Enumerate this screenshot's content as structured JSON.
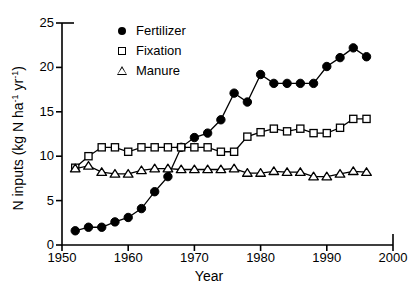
{
  "chart_data": {
    "type": "line",
    "title": "",
    "xlabel": "Year",
    "ylabel": "N inputs (kg N ha-1 yr-1)",
    "ylabel_parts": {
      "prefix": "N inputs (kg N ha",
      "sup1": "-1",
      "mid": " yr",
      "sup2": "-1",
      "suffix": ")"
    },
    "xlim": [
      1950,
      2000
    ],
    "ylim": [
      0,
      25
    ],
    "xticks": [
      1950,
      1960,
      1970,
      1980,
      1990,
      2000
    ],
    "yticks": [
      0,
      5,
      10,
      15,
      20,
      25
    ],
    "grid": false,
    "legend_position": "top-left inside",
    "x": [
      1952,
      1954,
      1956,
      1958,
      1960,
      1962,
      1964,
      1966,
      1968,
      1970,
      1972,
      1974,
      1976,
      1978,
      1980,
      1982,
      1984,
      1986,
      1988,
      1990,
      1992,
      1994,
      1996
    ],
    "series": [
      {
        "name": "Fertilizer",
        "marker": "filled-circle",
        "color": "#000000",
        "values": [
          1.6,
          2.0,
          2.0,
          2.6,
          3.1,
          4.1,
          6.0,
          7.7,
          11.0,
          12.1,
          12.6,
          14.1,
          17.1,
          16.1,
          19.2,
          18.2,
          18.2,
          18.2,
          18.2,
          20.1,
          21.1,
          22.2,
          21.2
        ]
      },
      {
        "name": "Fixation",
        "marker": "open-square",
        "color": "#000000",
        "values": [
          8.7,
          10.0,
          11.0,
          11.0,
          10.5,
          11.0,
          11.0,
          11.0,
          11.0,
          11.0,
          11.0,
          10.5,
          10.5,
          12.2,
          12.7,
          13.1,
          12.8,
          13.1,
          12.6,
          12.6,
          13.2,
          14.2,
          14.2
        ]
      },
      {
        "name": "Manure",
        "marker": "open-triangle",
        "color": "#000000",
        "values": [
          8.6,
          8.9,
          8.2,
          8.0,
          8.0,
          8.4,
          8.6,
          8.6,
          8.5,
          8.5,
          8.5,
          8.5,
          8.6,
          8.1,
          8.1,
          8.3,
          8.2,
          8.2,
          7.7,
          7.7,
          8.0,
          8.3,
          8.2
        ]
      }
    ]
  },
  "axes": {
    "y_tick_labels": [
      "0",
      "5",
      "10",
      "15",
      "20",
      "25"
    ],
    "x_tick_labels": [
      "1950",
      "1960",
      "1970",
      "1980",
      "1990",
      "2000"
    ],
    "x_title": "Year"
  },
  "legend": {
    "items": [
      {
        "label": "Fertilizer",
        "marker": "filled-circle"
      },
      {
        "label": "Fixation",
        "marker": "open-square"
      },
      {
        "label": "Manure",
        "marker": "open-triangle"
      }
    ]
  }
}
